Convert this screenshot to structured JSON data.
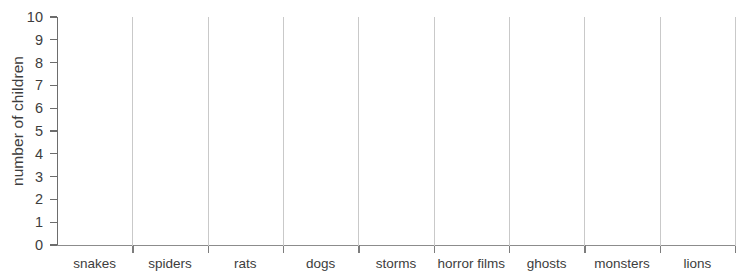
{
  "chart_data": {
    "type": "bar",
    "title": "",
    "xlabel": "",
    "ylabel": "number of children",
    "categories": [
      "snakes",
      "spiders",
      "rats",
      "dogs",
      "storms",
      "horror films",
      "ghosts",
      "monsters",
      "lions"
    ],
    "values": [
      0,
      0,
      0,
      0,
      0,
      0,
      0,
      0,
      0
    ],
    "ytick_labels": [
      "10",
      "9",
      "8",
      "7",
      "6",
      "5",
      "4",
      "3",
      "2",
      "1",
      "0"
    ],
    "ylim": [
      0,
      10
    ],
    "ytick_step": 1,
    "grid": "vertical-category-dividers",
    "legend": "none",
    "note": "blank grid template, no bars drawn"
  },
  "colors": {
    "background": "#ffffff",
    "axis": "#6d6d6d",
    "gridline": "#c9c9c9",
    "text": "#3d3d3d"
  }
}
